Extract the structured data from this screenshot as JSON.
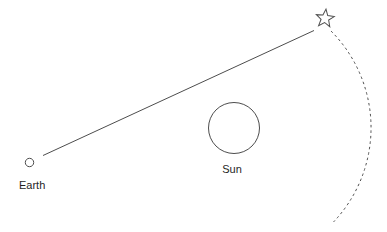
{
  "diagram": {
    "labels": {
      "earth": "Earth",
      "sun": "Sun"
    },
    "icons": {
      "star": "☆"
    },
    "colors": {
      "background": "#ffffff",
      "stroke": "#4d4d4d",
      "text": "#1f1f1f"
    }
  }
}
